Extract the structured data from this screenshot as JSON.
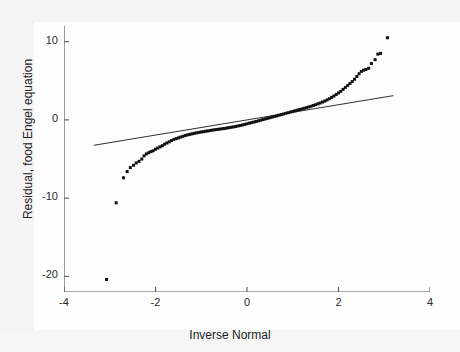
{
  "chart_data": {
    "type": "scatter",
    "title": "",
    "xlabel": "Inverse Normal",
    "ylabel": "Residual, food Engel equation",
    "xlim": [
      -4,
      4
    ],
    "ylim": [
      -22,
      12
    ],
    "xticks": [
      -4,
      -2,
      0,
      2,
      4
    ],
    "xtick_labels": [
      "-4",
      "-2",
      "0",
      "2",
      "4"
    ],
    "yticks": [
      10,
      0,
      -10,
      -20
    ],
    "ytick_labels": [
      "10",
      "0",
      "-10",
      "-20"
    ],
    "grid": false,
    "legend": "none",
    "marker_color": "#111111",
    "reference_line": {
      "label": "45-degree reference line",
      "color": "#1a1a1a",
      "x": [
        -3.35,
        3.2
      ],
      "y": [
        -3.25,
        3.1
      ]
    },
    "series": [
      {
        "name": "Residual, food Engel equation",
        "points": [
          [
            -3.07,
            -20.4
          ],
          [
            -2.86,
            -10.6
          ],
          [
            -2.7,
            -7.4
          ],
          [
            -2.62,
            -6.6
          ],
          [
            -2.55,
            -6.1
          ],
          [
            -2.48,
            -5.8
          ],
          [
            -2.42,
            -5.5
          ],
          [
            -2.36,
            -5.3
          ],
          [
            -2.3,
            -5.0
          ],
          [
            -2.25,
            -4.6
          ],
          [
            -2.2,
            -4.35
          ],
          [
            -2.15,
            -4.2
          ],
          [
            -2.1,
            -4.05
          ],
          [
            -2.05,
            -3.95
          ],
          [
            -2.0,
            -3.75
          ],
          [
            -1.95,
            -3.6
          ],
          [
            -1.9,
            -3.45
          ],
          [
            -1.85,
            -3.3
          ],
          [
            -1.8,
            -3.1
          ],
          [
            -1.75,
            -2.95
          ],
          [
            -1.7,
            -2.8
          ],
          [
            -1.65,
            -2.65
          ],
          [
            -1.6,
            -2.5
          ],
          [
            -1.55,
            -2.4
          ],
          [
            -1.5,
            -2.3
          ],
          [
            -1.45,
            -2.2
          ],
          [
            -1.4,
            -2.1
          ],
          [
            -1.35,
            -2.0
          ],
          [
            -1.3,
            -1.92
          ],
          [
            -1.25,
            -1.85
          ],
          [
            -1.2,
            -1.78
          ],
          [
            -1.15,
            -1.72
          ],
          [
            -1.1,
            -1.66
          ],
          [
            -1.05,
            -1.6
          ],
          [
            -1.0,
            -1.55
          ],
          [
            -0.95,
            -1.5
          ],
          [
            -0.9,
            -1.45
          ],
          [
            -0.85,
            -1.4
          ],
          [
            -0.8,
            -1.35
          ],
          [
            -0.75,
            -1.3
          ],
          [
            -0.7,
            -1.26
          ],
          [
            -0.65,
            -1.22
          ],
          [
            -0.6,
            -1.18
          ],
          [
            -0.55,
            -1.14
          ],
          [
            -0.5,
            -1.1
          ],
          [
            -0.45,
            -1.05
          ],
          [
            -0.4,
            -1.0
          ],
          [
            -0.35,
            -0.95
          ],
          [
            -0.3,
            -0.9
          ],
          [
            -0.25,
            -0.85
          ],
          [
            -0.2,
            -0.78
          ],
          [
            -0.15,
            -0.72
          ],
          [
            -0.1,
            -0.65
          ],
          [
            -0.05,
            -0.58
          ],
          [
            0.0,
            -0.5
          ],
          [
            0.05,
            -0.42
          ],
          [
            0.1,
            -0.35
          ],
          [
            0.15,
            -0.28
          ],
          [
            0.2,
            -0.2
          ],
          [
            0.25,
            -0.12
          ],
          [
            0.3,
            -0.04
          ],
          [
            0.35,
            0.04
          ],
          [
            0.4,
            0.12
          ],
          [
            0.45,
            0.2
          ],
          [
            0.5,
            0.28
          ],
          [
            0.55,
            0.36
          ],
          [
            0.6,
            0.44
          ],
          [
            0.65,
            0.52
          ],
          [
            0.7,
            0.6
          ],
          [
            0.75,
            0.68
          ],
          [
            0.8,
            0.76
          ],
          [
            0.85,
            0.84
          ],
          [
            0.9,
            0.92
          ],
          [
            0.95,
            1.0
          ],
          [
            1.0,
            1.08
          ],
          [
            1.05,
            1.16
          ],
          [
            1.1,
            1.24
          ],
          [
            1.15,
            1.32
          ],
          [
            1.2,
            1.4
          ],
          [
            1.25,
            1.48
          ],
          [
            1.3,
            1.56
          ],
          [
            1.35,
            1.65
          ],
          [
            1.4,
            1.74
          ],
          [
            1.45,
            1.84
          ],
          [
            1.5,
            1.94
          ],
          [
            1.55,
            2.05
          ],
          [
            1.6,
            2.16
          ],
          [
            1.65,
            2.28
          ],
          [
            1.7,
            2.4
          ],
          [
            1.75,
            2.55
          ],
          [
            1.8,
            2.7
          ],
          [
            1.85,
            2.88
          ],
          [
            1.9,
            3.05
          ],
          [
            1.95,
            3.25
          ],
          [
            2.0,
            3.45
          ],
          [
            2.05,
            3.65
          ],
          [
            2.1,
            3.9
          ],
          [
            2.15,
            4.15
          ],
          [
            2.2,
            4.4
          ],
          [
            2.25,
            4.65
          ],
          [
            2.3,
            4.9
          ],
          [
            2.35,
            5.2
          ],
          [
            2.4,
            5.55
          ],
          [
            2.45,
            5.9
          ],
          [
            2.5,
            6.2
          ],
          [
            2.55,
            6.35
          ],
          [
            2.6,
            6.45
          ],
          [
            2.66,
            6.6
          ],
          [
            2.72,
            7.2
          ],
          [
            2.8,
            7.7
          ],
          [
            2.86,
            8.4
          ],
          [
            2.92,
            8.5
          ],
          [
            3.07,
            10.5
          ]
        ]
      }
    ]
  }
}
